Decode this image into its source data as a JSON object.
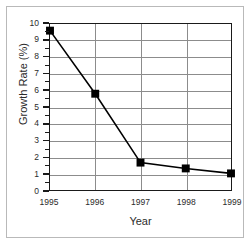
{
  "chart_data": {
    "type": "line",
    "title": "",
    "subtitle": "",
    "xlabel": "Year",
    "ylabel": "Growth Rate (%)",
    "categories": [
      "1995",
      "1996",
      "1997",
      "1998",
      "1999"
    ],
    "values": [
      9.6,
      5.8,
      1.65,
      1.3,
      1.0
    ],
    "series": [
      {
        "name": "Growth Rate",
        "values": [
          9.6,
          5.8,
          1.65,
          1.3,
          1.0
        ],
        "marker": "square",
        "marker_color": "#000000",
        "line_color": "#000000"
      }
    ],
    "ylim": [
      0,
      10
    ],
    "yticks": [
      0,
      1,
      2,
      3,
      4,
      5,
      6,
      7,
      8,
      9,
      10
    ],
    "ytick_labels": [
      "0",
      "1",
      "2",
      "3",
      "4",
      "5",
      "6",
      "7",
      "8",
      "9",
      "10"
    ],
    "xtick_labels": [
      "1995",
      "1996",
      "1997",
      "1998",
      "1999"
    ],
    "grid": "horizontal-and-vertical",
    "gridline_color": "#8c8c8c",
    "axis_color": "#1a1a1a",
    "legend": "none",
    "legend_position": "none",
    "annotations": [],
    "background_color": "#ffffff",
    "frame_color": "#b9b9b9"
  }
}
